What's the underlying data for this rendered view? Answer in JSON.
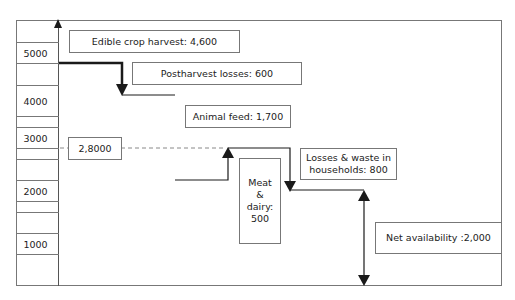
{
  "diagram": {
    "title": "",
    "axis": {
      "ticks": [
        {
          "label": "5000",
          "value": 5000
        },
        {
          "label": "4000",
          "value": 4000
        },
        {
          "label": "3000",
          "value": 3000
        },
        {
          "label": "2000",
          "value": 2000
        },
        {
          "label": "1000",
          "value": 1000
        }
      ]
    },
    "boxes": {
      "edible_crop_harvest": "Edible crop harvest:  4,600",
      "postharvest_losses": "Postharvest losses: 600",
      "animal_feed": "Animal feed: 1,700",
      "reference_level": "2,8000",
      "meat_dairy_lines": [
        "Meat",
        "&",
        "dairy:",
        "500"
      ],
      "household_losses_lines": [
        "Losses & waste in",
        "households: 800"
      ],
      "net_availability": "Net availability :2,000"
    },
    "flow": [
      {
        "step": "Edible crop harvest",
        "value": 4600
      },
      {
        "step": "Postharvest losses",
        "value": -600
      },
      {
        "step": "Animal feed",
        "value": -1700
      },
      {
        "step": "Meat & dairy",
        "value": 500
      },
      {
        "step": "Losses & waste in households",
        "value": -800
      },
      {
        "step": "Net availability",
        "value": 2000
      }
    ],
    "colors": {
      "line": "#1a1a1a",
      "border": "#777777",
      "dashed": "#888888"
    }
  }
}
